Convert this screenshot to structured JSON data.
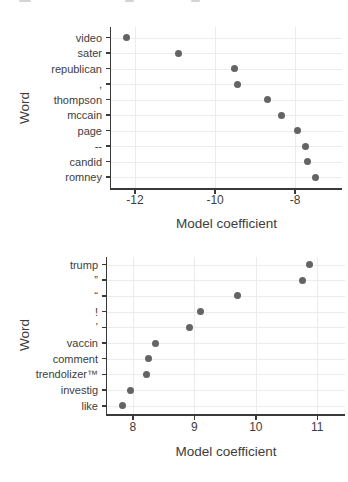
{
  "colors": {
    "point": "#646464",
    "axis": "#3a3a3a",
    "text": "#3d3d3d",
    "grid": "#ececec"
  },
  "chart_data": [
    {
      "type": "scatter",
      "variant": "cleveland-dot-plot",
      "orientation": "horizontal",
      "title": "",
      "xlabel": "Model coefficient",
      "ylabel": "Word",
      "categories": [
        "video",
        "sater",
        "republican",
        ",",
        "thompson",
        "mccain",
        "page",
        "--",
        "candid",
        "romney"
      ],
      "values": [
        -12.22,
        -10.92,
        -9.51,
        -9.44,
        -8.69,
        -8.33,
        -7.94,
        -7.73,
        -7.69,
        -7.5
      ],
      "x_ticks": [
        -12,
        -10,
        -8
      ],
      "x_tick_labels": [
        "-12",
        "-10",
        "-8"
      ],
      "xlim": [
        -12.6,
        -6.83
      ],
      "grid": true,
      "legend": false
    },
    {
      "type": "scatter",
      "variant": "cleveland-dot-plot",
      "orientation": "horizontal",
      "title": "",
      "xlabel": "Model coefficient",
      "ylabel": "Word",
      "categories": [
        "trump",
        "”",
        "“",
        "!",
        "’",
        "vaccin",
        "comment",
        "trendolizer™",
        "investig",
        "like"
      ],
      "values": [
        10.88,
        10.76,
        9.7,
        9.1,
        8.92,
        8.37,
        8.26,
        8.23,
        7.96,
        7.83
      ],
      "x_ticks": [
        8,
        9,
        10,
        11
      ],
      "x_tick_labels": [
        "8",
        "9",
        "10",
        "11"
      ],
      "xlim": [
        7.58,
        11.45
      ],
      "grid": true,
      "legend": false
    }
  ]
}
